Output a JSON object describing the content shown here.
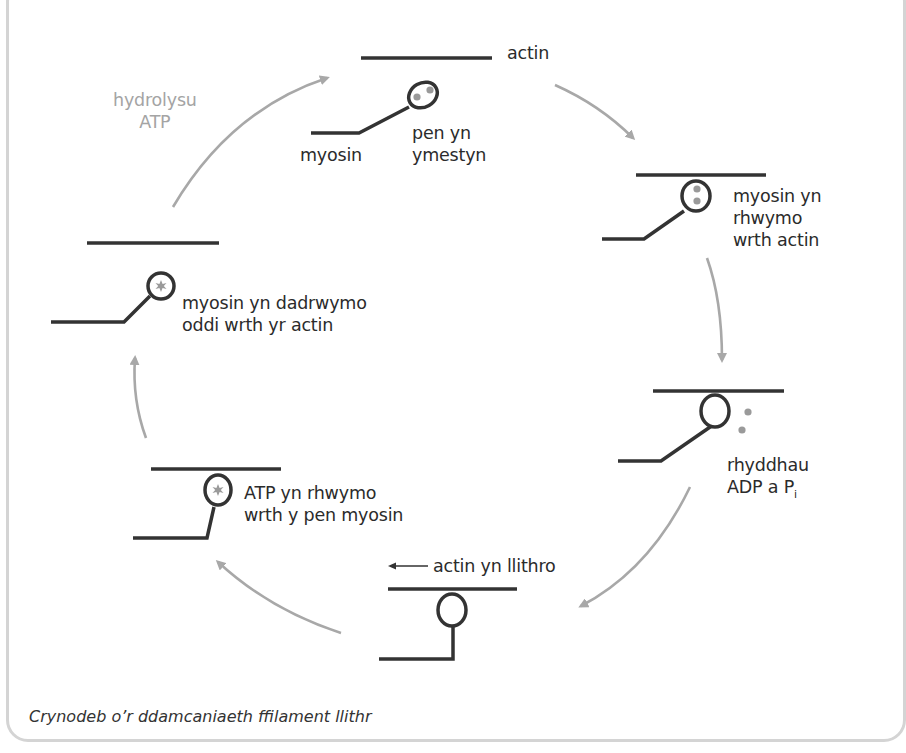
{
  "diagram": {
    "colors": {
      "filament": "#333333",
      "arrow": "#a8a8a8",
      "marker": "#9a9a9a",
      "grey_label": "#a4a4a4",
      "frame": "#d4d4d4"
    },
    "labels": {
      "actin": "actin",
      "myosin": "myosin",
      "head_extended": "pen yn\nymestyn",
      "myosin_binds": "myosin yn\nrhwymo\nwrth actin",
      "release_prefix": "rhyddhau\nADP a P",
      "release_sub": "i",
      "actin_slides": "actin yn llithro",
      "atp_binds": "ATP yn rhwymo\nwrth y pen myosin",
      "myosin_unbinds": "myosin yn dadrwymo\noddi wrth yr actin",
      "hydrolysis": "hydrolysu\nATP"
    },
    "stages": [
      {
        "id": 1,
        "name": "head-extended",
        "head_content": "two-dots (ADP + Pi)"
      },
      {
        "id": 2,
        "name": "myosin-binds-actin",
        "head_content": "two-dots (ADP + Pi)"
      },
      {
        "id": 3,
        "name": "release-adp-pi",
        "head_content": "empty, dots released"
      },
      {
        "id": 4,
        "name": "actin-slides",
        "head_content": "empty"
      },
      {
        "id": 5,
        "name": "atp-binds",
        "head_content": "star (ATP)"
      },
      {
        "id": 6,
        "name": "myosin-unbinds",
        "head_content": "star (ATP)"
      }
    ],
    "caption": "Crynodeb o’r ddamcaniaeth ffilament llithr"
  }
}
